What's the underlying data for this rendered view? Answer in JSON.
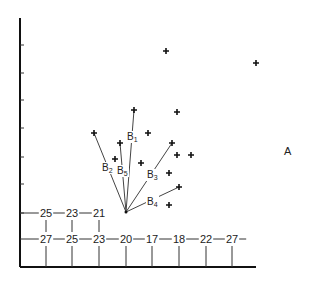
{
  "figure": {
    "region_label": "A",
    "colors": {
      "ink": "#111111",
      "background": "#ffffff"
    }
  },
  "axes": {
    "y_axis": {
      "x": 20,
      "top": 18,
      "bottom": 267
    },
    "x_axis": {
      "y": 267,
      "left": 20,
      "right": 256
    },
    "y_ticks": [
      45,
      73,
      100,
      128,
      157,
      184
    ]
  },
  "grid_rows": [
    {
      "y": 213,
      "values": [
        "25",
        "23",
        "21"
      ],
      "x_positions": [
        46,
        72,
        99
      ]
    },
    {
      "y": 239,
      "values": [
        "27",
        "25",
        "23",
        "20",
        "17",
        "18",
        "22",
        "27"
      ],
      "x_positions": [
        46,
        72,
        99,
        126,
        152,
        179,
        206,
        232
      ]
    }
  ],
  "vectors": {
    "origin": {
      "x": 126,
      "y": 212
    },
    "items": [
      {
        "name": "B",
        "sub": "1",
        "tip": {
          "x": 134,
          "y": 110
        },
        "label_pos": {
          "x": 127,
          "y": 140
        }
      },
      {
        "name": "B",
        "sub": "2",
        "tip": {
          "x": 94,
          "y": 133
        },
        "label_pos": {
          "x": 102,
          "y": 171
        }
      },
      {
        "name": "B",
        "sub": "3",
        "tip": {
          "x": 172,
          "y": 143
        },
        "label_pos": {
          "x": 147,
          "y": 178
        }
      },
      {
        "name": "B",
        "sub": "4",
        "tip": {
          "x": 179,
          "y": 187
        },
        "label_pos": {
          "x": 147,
          "y": 205
        }
      },
      {
        "name": "B",
        "sub": "5",
        "tip": {
          "x": 120,
          "y": 143
        },
        "label_pos": {
          "x": 117,
          "y": 174
        }
      }
    ]
  },
  "points": [
    {
      "x": 166,
      "y": 51
    },
    {
      "x": 256,
      "y": 63
    },
    {
      "x": 177,
      "y": 112
    },
    {
      "x": 148,
      "y": 133
    },
    {
      "x": 177,
      "y": 155
    },
    {
      "x": 191,
      "y": 155
    },
    {
      "x": 115,
      "y": 159
    },
    {
      "x": 141,
      "y": 163
    },
    {
      "x": 169,
      "y": 173
    },
    {
      "x": 169,
      "y": 205
    }
  ]
}
